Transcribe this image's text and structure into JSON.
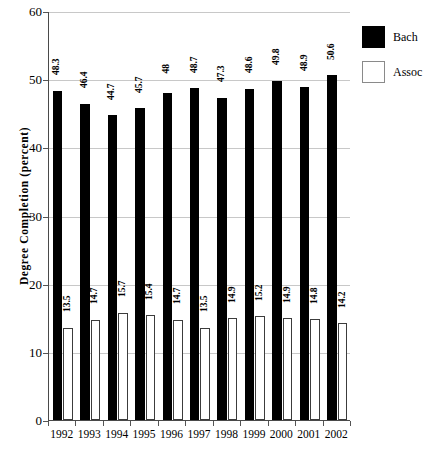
{
  "chart_data": {
    "type": "bar",
    "title": "",
    "xlabel": "",
    "ylabel": "Degree Completion (percent)",
    "categories": [
      "1992",
      "1993",
      "1994",
      "1995",
      "1996",
      "1997",
      "1998",
      "1999",
      "2000",
      "2001",
      "2002"
    ],
    "series": [
      {
        "name": "Bach",
        "color": "#000000",
        "values": [
          48.3,
          46.4,
          44.7,
          45.7,
          48,
          48.7,
          47.3,
          48.6,
          49.8,
          48.9,
          50.6
        ],
        "value_labels": [
          "48.3",
          "46.4",
          "44.7",
          "45.7",
          "48",
          "48.7",
          "47.3",
          "48.6",
          "49.8",
          "48.9",
          "50.6"
        ]
      },
      {
        "name": "Assoc",
        "color": "#ffffff",
        "values": [
          13.5,
          14.7,
          15.7,
          15.4,
          14.7,
          13.5,
          14.9,
          15.2,
          14.9,
          14.8,
          14.2
        ],
        "value_labels": [
          "13.5",
          "14.7",
          "15.7",
          "15.4",
          "14.7",
          "13.5",
          "14.9",
          "15.2",
          "14.9",
          "14.8",
          "14.2"
        ]
      }
    ],
    "ylim": [
      0,
      60
    ],
    "ytick_labels": [
      "0",
      "10",
      "20",
      "30",
      "40",
      "50",
      "60"
    ],
    "ytick_values": [
      0,
      10,
      20,
      30,
      40,
      50,
      60
    ],
    "grid": true,
    "legend_position": "right",
    "legend_entries": [
      "Bach",
      "Assoc"
    ]
  }
}
